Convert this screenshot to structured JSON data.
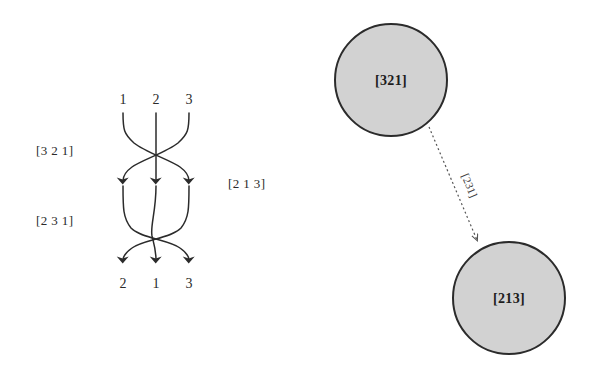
{
  "figure": {
    "background_color": "#ffffff",
    "stroke_color": "#2b2b2b",
    "node_fill_color": "#d2d2d2",
    "edge_color": "#555555"
  },
  "braid": {
    "top_strand_numbers": [
      "1",
      "2",
      "3"
    ],
    "bottom_strand_numbers": [
      "2",
      "1",
      "3"
    ],
    "left_label_upper": "[3 2 1]",
    "left_label_lower": "[2 3 1]",
    "right_label": "[2 1 3]"
  },
  "graph": {
    "nodes": [
      {
        "id": "n1",
        "label": "[321]",
        "cx": 391,
        "cy": 80,
        "r": 56
      },
      {
        "id": "n2",
        "label": "[213]",
        "cx": 509,
        "cy": 298,
        "r": 56
      }
    ],
    "edges": [
      {
        "from": "n1",
        "to": "n2",
        "label": "[231]",
        "style": "dashed",
        "arrow": "end"
      }
    ]
  }
}
